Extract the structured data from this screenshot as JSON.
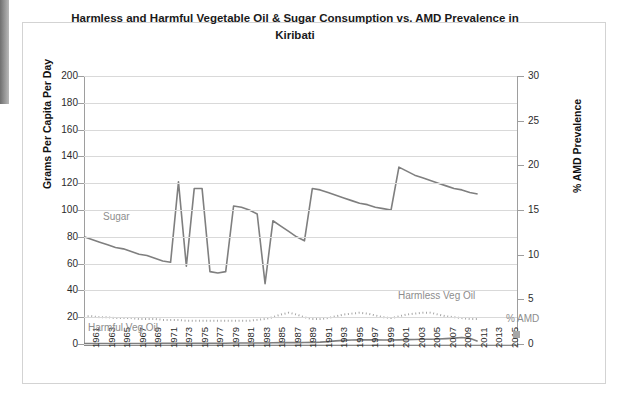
{
  "chart_data": {
    "type": "line",
    "title": "Harmless and Harmful Vegetable Oil & Sugar Consumption vs. AMD Prevalence in Kiribati",
    "xlabel": "",
    "ylabel": "Grams Per Capita Per Day",
    "y2label": "% AMD Prevalence",
    "ylim": [
      0,
      200
    ],
    "y2lim": [
      0,
      30
    ],
    "grid": true,
    "legend_position": "inline-annotations",
    "y_ticks": [
      "0",
      "20",
      "40",
      "60",
      "80",
      "100",
      "120",
      "140",
      "160",
      "180",
      "200"
    ],
    "y2_ticks": [
      "0",
      "5",
      "10",
      "15",
      "20",
      "25",
      "30"
    ],
    "x_tick_labels": [
      "1961",
      "1963",
      "1965",
      "1967",
      "1969",
      "1971",
      "1973",
      "1975",
      "1977",
      "1979",
      "1981",
      "1983",
      "1985",
      "1987",
      "1989",
      "1991",
      "1993",
      "1995",
      "1997",
      "1999",
      "2001",
      "2003",
      "2005",
      "2007",
      "2009",
      "2011",
      "2013",
      "2015"
    ],
    "x": [
      1961,
      1962,
      1963,
      1964,
      1965,
      1966,
      1967,
      1968,
      1969,
      1970,
      1971,
      1972,
      1973,
      1974,
      1975,
      1976,
      1977,
      1978,
      1979,
      1980,
      1981,
      1982,
      1983,
      1984,
      1985,
      1986,
      1987,
      1988,
      1989,
      1990,
      1991,
      1992,
      1993,
      1994,
      1995,
      1996,
      1997,
      1998,
      1999,
      2000,
      2001,
      2002,
      2003,
      2004,
      2005,
      2006,
      2007,
      2008,
      2009,
      2010,
      2011
    ],
    "series": [
      {
        "name": "Sugar",
        "axis": "left",
        "color": "#7f7f7f",
        "style": "solid",
        "label_color": "#8d8d8d",
        "values": [
          80,
          78,
          76,
          74,
          72,
          71,
          69,
          67,
          66,
          64,
          62,
          61,
          121,
          58,
          116,
          116,
          54,
          53,
          54,
          103,
          102,
          100,
          97,
          45,
          92,
          88,
          84,
          80,
          77,
          116,
          115,
          113,
          111,
          109,
          107,
          105,
          104,
          102,
          101,
          100,
          132,
          129,
          126,
          124,
          122,
          120,
          118,
          116,
          115,
          113,
          112
        ]
      },
      {
        "name": "Harmful Veg Oil",
        "axis": "right",
        "color": "#a6a6a6",
        "style": "dotted",
        "label_color": "#8d8d8d",
        "values": [
          3.1,
          3.1,
          3.0,
          3.0,
          2.9,
          2.9,
          2.9,
          2.8,
          2.8,
          2.8,
          2.7,
          2.7,
          2.7,
          2.6,
          2.6,
          2.6,
          2.6,
          2.6,
          2.6,
          2.6,
          2.6,
          2.6,
          2.7,
          2.8,
          3.0,
          3.3,
          3.5,
          3.3,
          3.0,
          2.8,
          2.8,
          2.9,
          3.1,
          3.3,
          3.4,
          3.5,
          3.4,
          3.2,
          3.0,
          2.9,
          3.1,
          3.3,
          3.4,
          3.5,
          3.5,
          3.3,
          3.1,
          3.0,
          2.9,
          2.8,
          2.8
        ]
      },
      {
        "name": "Harmless Veg Oil",
        "axis": "left",
        "color": "#7f7f7f",
        "style": "solid",
        "label_color": "#8d8d8d",
        "values": [
          0.4,
          0.4,
          0.4,
          0.4,
          0.4,
          0.4,
          0.4,
          0.4,
          0.5,
          0.5,
          0.5,
          0.5,
          0.5,
          0.5,
          0.6,
          0.6,
          0.6,
          0.6,
          0.6,
          0.7,
          0.7,
          0.7,
          0.8,
          0.8,
          0.9,
          1.0,
          1.0,
          1.0,
          1.1,
          1.2,
          1.4,
          1.8,
          2.3,
          2.7,
          3.0,
          3.1,
          3.2,
          3.1,
          3.0,
          3.0,
          3.1,
          3.3,
          3.4,
          3.5,
          3.6,
          3.7,
          4.0,
          4.4,
          4.8,
          4.2,
          2.0
        ]
      },
      {
        "name": "% AMD",
        "axis": "right",
        "color": "#a6a6a6",
        "style": "marker",
        "label_color": "#a6a6a6",
        "values": [
          null,
          null,
          null,
          null,
          null,
          null,
          null,
          null,
          null,
          null,
          null,
          null,
          null,
          null,
          null,
          null,
          null,
          null,
          null,
          null,
          null,
          null,
          null,
          null,
          null,
          null,
          null,
          null,
          null,
          null,
          null,
          null,
          null,
          null,
          null,
          null,
          null,
          null,
          null,
          null,
          null,
          null,
          null,
          null,
          null,
          null,
          null,
          null,
          null,
          null,
          0.4
        ]
      }
    ],
    "annotations": [
      {
        "text": "Sugar",
        "near": "sugar-series"
      },
      {
        "text": "Harmful Veg Oil",
        "near": "harmful-series"
      },
      {
        "text": "Harmless Veg Oil",
        "near": "harmless-series"
      },
      {
        "text": "% AMD",
        "near": "amd-series"
      }
    ],
    "colors": {
      "series_dark": "#7f7f7f",
      "series_light": "#a6a6a6",
      "gridline": "#d9d9d9",
      "axis": "#9e9e9e",
      "text": "#2b2b2b"
    }
  }
}
